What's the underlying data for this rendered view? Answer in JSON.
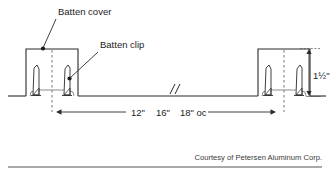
{
  "diagram": {
    "colors": {
      "line": "#2b2b2b",
      "line_light": "#555555",
      "background": "#ffffff",
      "text": "#1c1c1c",
      "credit_text": "#3a3a3a",
      "rule": "#555555"
    },
    "callouts": [
      {
        "id": "batten-cover",
        "label": "Batten cover",
        "text_x": 58,
        "text_y": 14,
        "leader_from_x": 56,
        "leader_from_y": 18,
        "leader_to_x": 43,
        "leader_to_y": 49,
        "dot_x": 43,
        "dot_y": 49
      },
      {
        "id": "batten-clip",
        "label": "Batten clip",
        "text_x": 100,
        "text_y": 47,
        "leader_from_x": 99,
        "leader_from_y": 51,
        "leader_to_x": 69,
        "leader_to_y": 79,
        "dot_x": 69,
        "dot_y": 79
      }
    ],
    "dimensions": {
      "vertical": {
        "id": "height-dimension",
        "label": "1½\"",
        "text_x": 313,
        "text_y": 79,
        "arrow_x": 309,
        "top_y": 50,
        "bottom_y": 97,
        "ext_top_y": 48,
        "ext_bottom_y": 97,
        "ext_from_x": 296,
        "ext_to_x": 321
      },
      "horizontal": {
        "id": "spacing-dimension",
        "segments": [
          "12\"",
          "16\"",
          "18\" oc"
        ],
        "text_full": "12\"   16\"   18\" oc",
        "text_x": 166,
        "text_y": 116,
        "line_y": 112,
        "left_arrow_x": 57,
        "right_arrow_x": 275,
        "gap_start_x": 126,
        "gap_end_x": 208
      }
    },
    "break_symbol": {
      "id": "break-symbol",
      "x": 172,
      "y": 90
    },
    "assemblies": [
      {
        "id": "left-batten-assembly",
        "cover_left": 26,
        "cover_right": 78,
        "cover_top": 49,
        "cover_bottom": 97,
        "centerline_x": 52,
        "centerline_top": 50,
        "centerline_bottom": 112,
        "clip_left_x": 33,
        "clip_right_x": 70,
        "clip_top_y": 65,
        "clip_base_y": 95
      },
      {
        "id": "right-batten-assembly",
        "cover_left": 258,
        "cover_right": 310,
        "cover_top": 49,
        "cover_bottom": 97,
        "centerline_x": 284,
        "centerline_top": 50,
        "centerline_bottom": 112,
        "clip_left_x": 265,
        "clip_right_x": 302,
        "clip_top_y": 65,
        "clip_base_y": 95
      }
    ],
    "deck_line": {
      "id": "deck-line",
      "y": 96,
      "x_start": 8,
      "x_end": 326
    },
    "credit": {
      "text": "Courtesy of Petersen Aluminum Corp.",
      "text_x": 322,
      "text_y": 160,
      "rule_y": 167,
      "rule_x_start": 8,
      "rule_x_end": 322
    }
  }
}
